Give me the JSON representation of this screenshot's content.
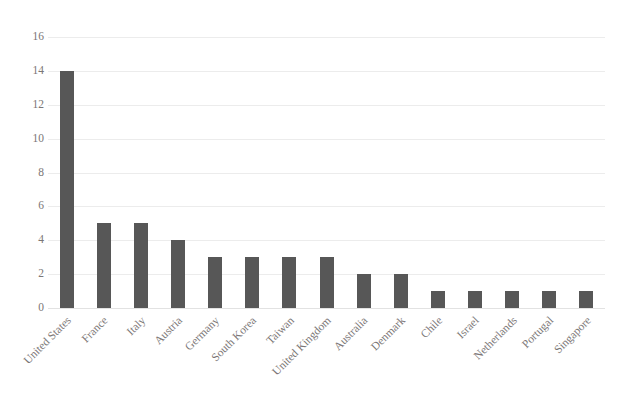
{
  "chart_data": {
    "type": "bar",
    "title": "",
    "xlabel": "",
    "ylabel": "",
    "categories": [
      "United States",
      "France",
      "Italy",
      "Austria",
      "Germany",
      "South Korea",
      "Taiwan",
      "United Kingdom",
      "Australia",
      "Denmark",
      "Chile",
      "Israel",
      "Netherlands",
      "Portugal",
      "Singapore"
    ],
    "values": [
      14,
      5,
      5,
      4,
      3,
      3,
      3,
      3,
      2,
      2,
      1,
      1,
      1,
      1,
      1
    ],
    "ylim": [
      0,
      16
    ],
    "ytick_step": 2,
    "yticks": [
      0,
      2,
      4,
      6,
      8,
      10,
      12,
      14,
      16
    ],
    "ytick_labels": [
      "0",
      "2",
      "4",
      "6",
      "8",
      "10",
      "12",
      "14",
      "16"
    ],
    "grid": "horizontal",
    "legend": "none",
    "series": [
      {
        "name": "Count",
        "values": [
          14,
          5,
          5,
          4,
          3,
          3,
          3,
          3,
          2,
          2,
          1,
          1,
          1,
          1,
          1
        ]
      }
    ],
    "colors": {
      "bar": "#575757",
      "gridline": "#ececec",
      "baseline": "#e2e2e2",
      "tick_label": "#7b7676",
      "background": "#ffffff",
      "title": "#3c3c3c"
    },
    "xlabel_rotation_deg": -45
  }
}
